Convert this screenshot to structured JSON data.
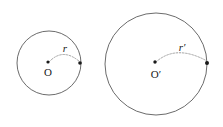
{
  "figure": {
    "type": "geometry-diagram",
    "background_color": "#ffffff",
    "stroke_color": "#5a5a5a",
    "dot_color": "#1a1a1a",
    "arc_color": "#8a8a8a",
    "shapes": [
      {
        "id": "small-circle",
        "center_label": "O",
        "radius_label": "r",
        "cx": 49,
        "cy": 63,
        "r": 32,
        "center_dot": {
          "x": 48,
          "y": 62,
          "radius": 1.6
        },
        "edge_dot": {
          "x": 80,
          "y": 63,
          "radius": 1.8
        },
        "center_label_pos": {
          "x": 48,
          "y": 76
        },
        "radius_label_pos": {
          "x": 65,
          "y": 52
        },
        "arc_path": "M 49 62 Q 63 47 80 62"
      },
      {
        "id": "large-circle",
        "center_label": "O′",
        "radius_label": "r′",
        "cx": 156,
        "cy": 64,
        "r": 51,
        "center_dot": {
          "x": 155,
          "y": 62,
          "radius": 1.7
        },
        "edge_dot": {
          "x": 207,
          "y": 63,
          "radius": 2.0
        },
        "center_label_pos": {
          "x": 156,
          "y": 78
        },
        "radius_label_pos": {
          "x": 182,
          "y": 51
        },
        "arc_path": "M 156 62 Q 176 44 207 61"
      }
    ]
  }
}
